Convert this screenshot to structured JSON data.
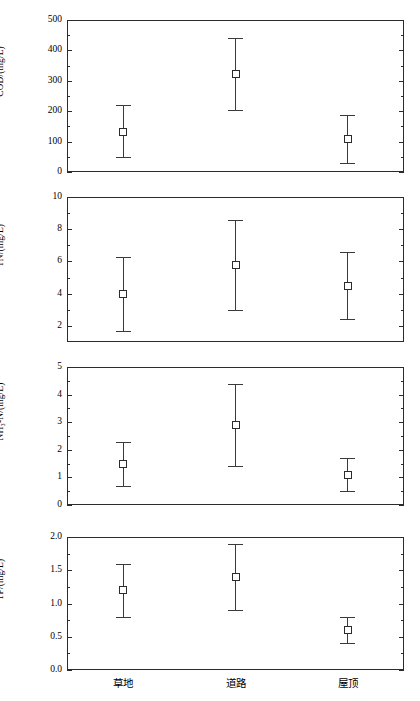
{
  "chart_data": {
    "type": "scatter",
    "title": "",
    "subtitle": "",
    "xlabel": "",
    "grid": false,
    "legend_position": "none",
    "marker": "open-square",
    "error_bar_style": "capped-vertical",
    "categories": [
      "草地",
      "道路",
      "屋顶"
    ],
    "category_labels_en": [
      "Grassland",
      "Road",
      "Rooftop"
    ],
    "panels": [
      {
        "id": "cod",
        "ylabel": "COD/(mg/L)",
        "ylim": [
          0,
          500
        ],
        "yticks": [
          0,
          100,
          200,
          300,
          400,
          500
        ],
        "ytick_labels": [
          "0",
          "100",
          "200",
          "300",
          "400",
          "500"
        ],
        "minor_ticks_per_interval": 1,
        "values": [
          133,
          322,
          108
        ],
        "err_low": [
          48,
          203,
          30
        ],
        "err_high": [
          219,
          441,
          188
        ]
      },
      {
        "id": "tn",
        "ylabel": "TN/(mg/L)",
        "ylim": [
          1,
          10
        ],
        "yticks": [
          2,
          4,
          6,
          8,
          10
        ],
        "ytick_labels": [
          "2",
          "4",
          "6",
          "8",
          "10"
        ],
        "minor_ticks_per_interval": 1,
        "values": [
          4.0,
          5.8,
          4.5
        ],
        "err_low": [
          1.7,
          3.0,
          2.4
        ],
        "err_high": [
          6.3,
          8.6,
          6.6
        ]
      },
      {
        "id": "nh3n",
        "ylabel": "NH₃-N/(mg/L)",
        "ylim": [
          0,
          5
        ],
        "yticks": [
          0,
          1,
          2,
          3,
          4,
          5
        ],
        "ytick_labels": [
          "0",
          "1",
          "2",
          "3",
          "4",
          "5"
        ],
        "minor_ticks_per_interval": 1,
        "values": [
          1.5,
          2.9,
          1.1
        ],
        "err_low": [
          0.7,
          1.4,
          0.5
        ],
        "err_high": [
          2.3,
          4.4,
          1.7
        ]
      },
      {
        "id": "tp",
        "ylabel": "TP/(mg/L)",
        "ylim": [
          0.0,
          2.0
        ],
        "yticks": [
          0.0,
          0.5,
          1.0,
          1.5,
          2.0
        ],
        "ytick_labels": [
          "0.0",
          "0.5",
          "1.0",
          "1.5",
          "2.0"
        ],
        "minor_ticks_per_interval": 1,
        "values": [
          1.2,
          1.4,
          0.6
        ],
        "err_low": [
          0.8,
          0.9,
          0.4
        ],
        "err_high": [
          1.6,
          1.9,
          0.8
        ]
      }
    ],
    "colors": {
      "axis": "#2b2b2b",
      "marker_edge": "#2b2b2b",
      "marker_fill": "#ffffff",
      "error_bar": "#3a3a3a",
      "background": "#ffffff"
    }
  }
}
